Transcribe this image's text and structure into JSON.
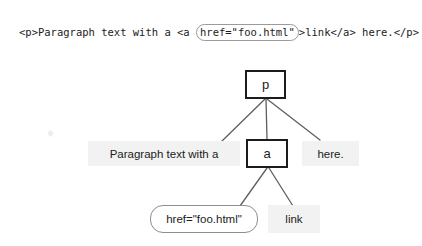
{
  "figure": {
    "code_line": {
      "before": "<p>Paragraph text with a <a ",
      "attribute": "href=\"foo.html\"",
      "after": ">link</a> here.</p>"
    },
    "tree": {
      "nodes": [
        {
          "id": "p",
          "label": "p",
          "kind": "element"
        },
        {
          "id": "text1",
          "label": "Paragraph text with a",
          "kind": "text"
        },
        {
          "id": "a",
          "label": "a",
          "kind": "element"
        },
        {
          "id": "text2",
          "label": "here.",
          "kind": "text"
        },
        {
          "id": "attr",
          "label": "href=\"foo.html\"",
          "kind": "attribute"
        },
        {
          "id": "text3",
          "label": "link",
          "kind": "text"
        }
      ],
      "edges": [
        {
          "from": "p",
          "to": "text1"
        },
        {
          "from": "p",
          "to": "a"
        },
        {
          "from": "p",
          "to": "text2"
        },
        {
          "from": "a",
          "to": "attr"
        },
        {
          "from": "a",
          "to": "text3"
        }
      ]
    },
    "colors": {
      "background": "#ffffff",
      "element_border": "#1c1c1c",
      "text_node_fill": "#f2f2f2",
      "attribute_border": "#8d8d8d",
      "connector": "#5f5f5f",
      "code_text": "#1b1b1b"
    }
  }
}
